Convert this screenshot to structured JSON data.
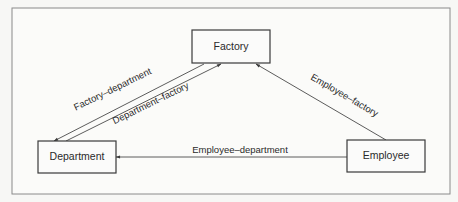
{
  "diagram": {
    "nodes": [
      {
        "id": "factory",
        "label": "Factory"
      },
      {
        "id": "department",
        "label": "Department"
      },
      {
        "id": "employee",
        "label": "Employee"
      }
    ],
    "edges": [
      {
        "from": "factory",
        "to": "department",
        "label": "Factory–department"
      },
      {
        "from": "department",
        "to": "factory",
        "label": "Department–factory"
      },
      {
        "from": "employee",
        "to": "factory",
        "label": "Employee–factory"
      },
      {
        "from": "employee",
        "to": "department",
        "label": "Employee–department"
      }
    ],
    "colors": {
      "stroke": "#3a3a3a",
      "background": "#fbfbfa"
    }
  }
}
